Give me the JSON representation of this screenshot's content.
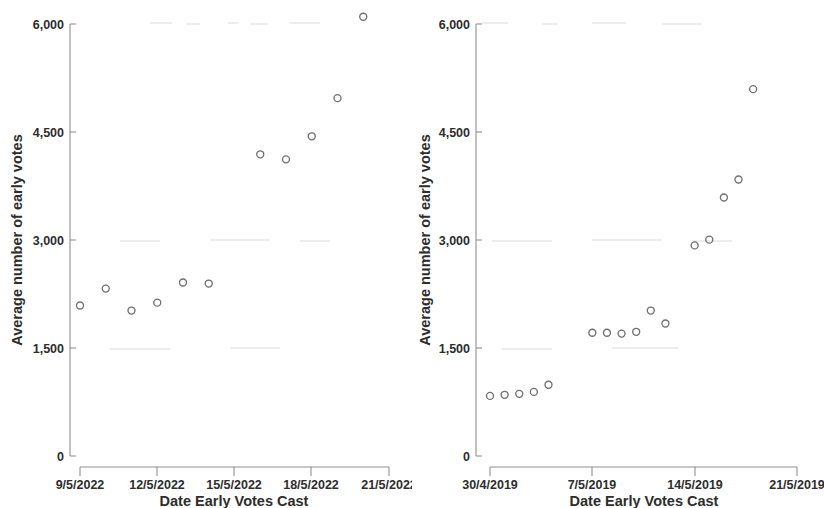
{
  "figure": {
    "background": "#ffffff",
    "marker_color": "#6d6f73",
    "axis_color": "#8e9094",
    "text_color": "#2d2d2d"
  },
  "chart_data": [
    {
      "type": "scatter",
      "title": "",
      "panel": "left",
      "xlabel": "Date Early Votes Cast",
      "ylabel": "Average number of early votes",
      "ylim": [
        0,
        6000
      ],
      "ytick_labels": [
        "0",
        "1,500",
        "3,000",
        "4,500",
        "6,000"
      ],
      "ytick_values": [
        0,
        1500,
        3000,
        4500,
        6000
      ],
      "xtick_labels": [
        "9/5/2022",
        "12/5/2022",
        "15/5/2022",
        "18/5/2022",
        "21/5/2022"
      ],
      "xtick_values": [
        "2022-05-09",
        "2022-05-12",
        "2022-05-15",
        "2022-05-18",
        "2022-05-21"
      ],
      "xlim": [
        "2022-05-09",
        "2022-05-21"
      ],
      "grid": false,
      "legend": "none",
      "points": [
        {
          "x": "2022-05-09",
          "y": 2090
        },
        {
          "x": "2022-05-10",
          "y": 2325
        },
        {
          "x": "2022-05-11",
          "y": 2020
        },
        {
          "x": "2022-05-12",
          "y": 2130
        },
        {
          "x": "2022-05-13",
          "y": 2410
        },
        {
          "x": "2022-05-14",
          "y": 2395
        },
        {
          "x": "2022-05-16",
          "y": 4190
        },
        {
          "x": "2022-05-17",
          "y": 4120
        },
        {
          "x": "2022-05-18",
          "y": 4440
        },
        {
          "x": "2022-05-19",
          "y": 4970
        },
        {
          "x": "2022-05-20",
          "y": 6100
        }
      ]
    },
    {
      "type": "scatter",
      "title": "",
      "panel": "right",
      "xlabel": "Date Early Votes Cast",
      "ylabel": "Average number of early votes",
      "ylim": [
        0,
        6000
      ],
      "ytick_labels": [
        "0",
        "1,500",
        "3,000",
        "4,500",
        "6,000"
      ],
      "ytick_values": [
        0,
        1500,
        3000,
        4500,
        6000
      ],
      "xtick_labels": [
        "30/4/2019",
        "7/5/2019",
        "14/5/2019",
        "21/5/2019"
      ],
      "xtick_values": [
        "2019-04-30",
        "2019-05-07",
        "2019-05-14",
        "2019-05-21"
      ],
      "xlim": [
        "2019-04-30",
        "2019-05-21"
      ],
      "grid": false,
      "legend": "none",
      "points": [
        {
          "x": "2019-04-30",
          "y": 835
        },
        {
          "x": "2019-05-01",
          "y": 850
        },
        {
          "x": "2019-05-02",
          "y": 863
        },
        {
          "x": "2019-05-03",
          "y": 890
        },
        {
          "x": "2019-05-04",
          "y": 990
        },
        {
          "x": "2019-05-07",
          "y": 1712
        },
        {
          "x": "2019-05-08",
          "y": 1712
        },
        {
          "x": "2019-05-09",
          "y": 1700
        },
        {
          "x": "2019-05-10",
          "y": 1725
        },
        {
          "x": "2019-05-11",
          "y": 2020
        },
        {
          "x": "2019-05-12",
          "y": 1840
        },
        {
          "x": "2019-05-14",
          "y": 2925
        },
        {
          "x": "2019-05-15",
          "y": 3005
        },
        {
          "x": "2019-05-16",
          "y": 3590
        },
        {
          "x": "2019-05-17",
          "y": 3840
        },
        {
          "x": "2019-05-18",
          "y": 5095
        }
      ]
    }
  ],
  "left_panel": {
    "ylabel": "Average number of early votes",
    "xlabel": "Date Early Votes Cast",
    "ytick_0": "0",
    "ytick_1": "1,500",
    "ytick_2": "3,000",
    "ytick_3": "4,500",
    "ytick_4": "6,000",
    "xtick_0": "9/5/2022",
    "xtick_1": "12/5/2022",
    "xtick_2": "15/5/2022",
    "xtick_3": "18/5/2022",
    "xtick_4": "21/5/2022"
  },
  "right_panel": {
    "ylabel": "Average number of early votes",
    "xlabel": "Date Early Votes Cast",
    "ytick_0": "0",
    "ytick_1": "1,500",
    "ytick_2": "3,000",
    "ytick_3": "4,500",
    "ytick_4": "6,000",
    "xtick_0": "30/4/2019",
    "xtick_1": "7/5/2019",
    "xtick_2": "14/5/2019",
    "xtick_3": "21/5/2019"
  }
}
